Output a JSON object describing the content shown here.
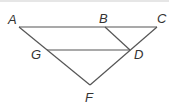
{
  "diagram": {
    "type": "geometry-figure",
    "points": {
      "A": {
        "label": "A",
        "x": 19,
        "y": 27,
        "lx": 8,
        "ly": 24
      },
      "B": {
        "label": "B",
        "x": 105,
        "y": 27,
        "lx": 98,
        "ly": 24
      },
      "C": {
        "label": "C",
        "x": 157,
        "y": 27,
        "lx": 157,
        "ly": 24
      },
      "D": {
        "label": "D",
        "x": 130,
        "y": 50,
        "lx": 133,
        "ly": 59
      },
      "G": {
        "label": "G",
        "x": 47,
        "y": 50,
        "lx": 30,
        "ly": 59
      },
      "F": {
        "label": "F",
        "x": 90,
        "y": 85,
        "lx": 84,
        "ly": 102
      }
    },
    "segments": [
      {
        "name": "segment-AC",
        "from": "A",
        "to": "C"
      },
      {
        "name": "segment-AF",
        "from": "A",
        "to": "F"
      },
      {
        "name": "segment-CF",
        "from": "C",
        "to": "F"
      },
      {
        "name": "segment-GD",
        "from": "G",
        "to": "D"
      },
      {
        "name": "segment-BD",
        "from": "B",
        "to": "D"
      }
    ]
  }
}
